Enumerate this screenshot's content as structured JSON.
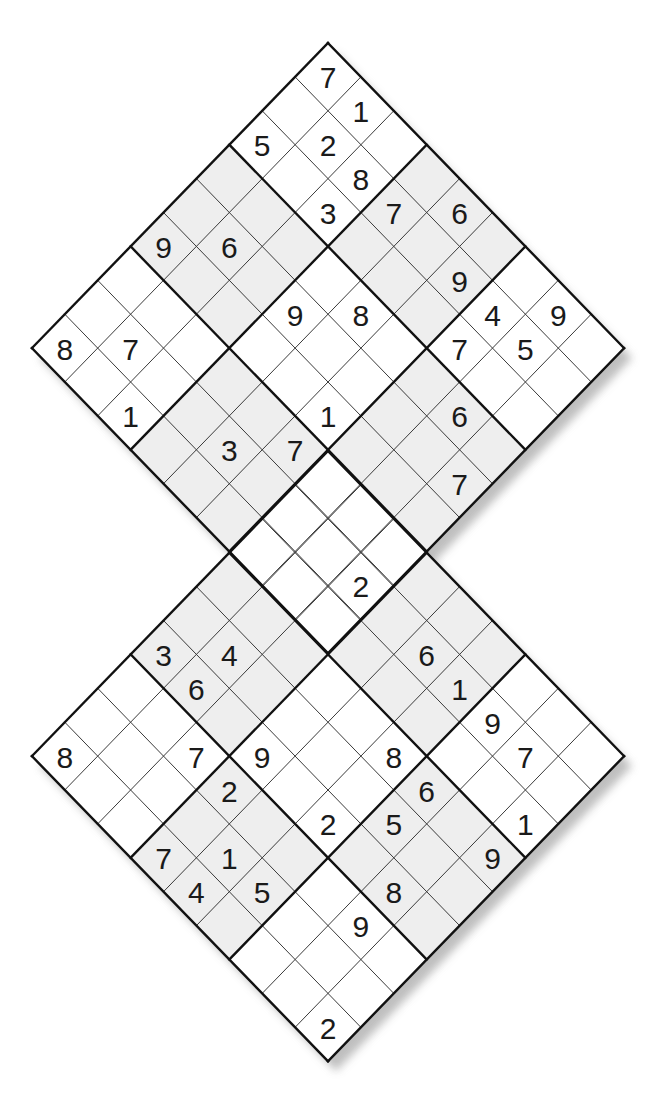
{
  "puzzle": {
    "type": "double-diamond-sudoku",
    "size": 9,
    "colors": {
      "background": "#ffffff",
      "shaded_box": "#eeeeee",
      "thin_line": "#3a3a3a",
      "thick_line": "#111111",
      "digit": "#1a1a1a",
      "shadow": "#b8b8b8"
    },
    "grids": [
      {
        "name": "top-diamond",
        "origin": [
          328,
          43
        ],
        "cell_dx": 32.9,
        "cell_dy": 33.9,
        "givens": [
          {
            "r": 0,
            "c": 0,
            "v": "7"
          },
          {
            "r": 1,
            "c": 0,
            "v": "1"
          },
          {
            "r": 0,
            "c": 2,
            "v": "5"
          },
          {
            "r": 1,
            "c": 1,
            "v": "2"
          },
          {
            "r": 2,
            "c": 1,
            "v": "8"
          },
          {
            "r": 2,
            "c": 2,
            "v": "3"
          },
          {
            "r": 3,
            "c": 1,
            "v": "7"
          },
          {
            "r": 4,
            "c": 0,
            "v": "6"
          },
          {
            "r": 0,
            "c": 5,
            "v": "9"
          },
          {
            "r": 1,
            "c": 4,
            "v": "6"
          },
          {
            "r": 5,
            "c": 1,
            "v": "9"
          },
          {
            "r": 3,
            "c": 4,
            "v": "9"
          },
          {
            "r": 4,
            "c": 3,
            "v": "8"
          },
          {
            "r": 6,
            "c": 1,
            "v": "4"
          },
          {
            "r": 7,
            "c": 0,
            "v": "9"
          },
          {
            "r": 0,
            "c": 8,
            "v": "8"
          },
          {
            "r": 1,
            "c": 7,
            "v": "7"
          },
          {
            "r": 6,
            "c": 2,
            "v": "7"
          },
          {
            "r": 7,
            "c": 1,
            "v": "5"
          },
          {
            "r": 2,
            "c": 8,
            "v": "1"
          },
          {
            "r": 5,
            "c": 5,
            "v": "1"
          },
          {
            "r": 7,
            "c": 3,
            "v": "6"
          },
          {
            "r": 4,
            "c": 7,
            "v": "3"
          },
          {
            "r": 5,
            "c": 6,
            "v": "7"
          },
          {
            "r": 8,
            "c": 4,
            "v": "7"
          },
          {
            "r": 8,
            "c": 7,
            "v": "2"
          }
        ]
      },
      {
        "name": "bottom-diamond",
        "origin": [
          328,
          451
        ],
        "cell_dx": 32.9,
        "cell_dy": 33.9,
        "givens": [
          {
            "r": 0,
            "c": 5,
            "v": "3"
          },
          {
            "r": 1,
            "c": 4,
            "v": "4"
          },
          {
            "r": 1,
            "c": 5,
            "v": "6"
          },
          {
            "r": 4,
            "c": 1,
            "v": "6"
          },
          {
            "r": 5,
            "c": 1,
            "v": "1"
          },
          {
            "r": 6,
            "c": 1,
            "v": "9"
          },
          {
            "r": 0,
            "c": 8,
            "v": "8"
          },
          {
            "r": 2,
            "c": 6,
            "v": "7"
          },
          {
            "r": 3,
            "c": 5,
            "v": "9"
          },
          {
            "r": 5,
            "c": 3,
            "v": "8"
          },
          {
            "r": 7,
            "c": 1,
            "v": "7"
          },
          {
            "r": 3,
            "c": 6,
            "v": "2"
          },
          {
            "r": 6,
            "c": 3,
            "v": "6"
          },
          {
            "r": 5,
            "c": 5,
            "v": "2"
          },
          {
            "r": 6,
            "c": 4,
            "v": "5"
          },
          {
            "r": 8,
            "c": 2,
            "v": "1"
          },
          {
            "r": 3,
            "c": 8,
            "v": "7"
          },
          {
            "r": 4,
            "c": 7,
            "v": "1"
          },
          {
            "r": 8,
            "c": 3,
            "v": "9"
          },
          {
            "r": 4,
            "c": 8,
            "v": "4"
          },
          {
            "r": 5,
            "c": 7,
            "v": "5"
          },
          {
            "r": 7,
            "c": 5,
            "v": "8"
          },
          {
            "r": 7,
            "c": 6,
            "v": "9"
          },
          {
            "r": 8,
            "c": 8,
            "v": "2"
          }
        ]
      }
    ],
    "overlap": {
      "top_grid_box": [
        2,
        2
      ],
      "bottom_grid_box": [
        0,
        0
      ]
    }
  }
}
